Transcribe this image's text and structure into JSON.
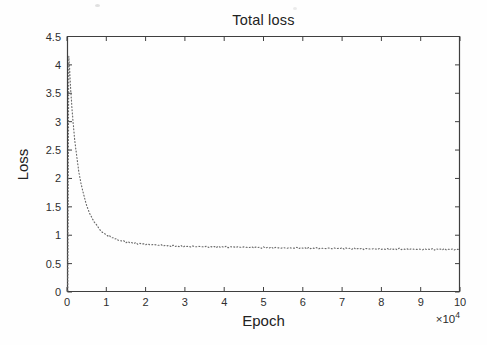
{
  "figure": {
    "title": "Total loss",
    "xlabel": "Epoch",
    "ylabel": "Loss",
    "x_multiplier_base": "×10",
    "x_multiplier_exp": "4"
  },
  "chart_data": {
    "type": "line",
    "title": "Total loss",
    "xlabel": "Epoch",
    "ylabel": "Loss",
    "x_scale_label": "×10^4",
    "xlim": [
      0,
      10
    ],
    "ylim": [
      0,
      4.5
    ],
    "x_ticks": [
      0,
      1,
      2,
      3,
      4,
      5,
      6,
      7,
      8,
      9,
      10
    ],
    "y_ticks": [
      0,
      0.5,
      1,
      1.5,
      2,
      2.5,
      3,
      3.5,
      4,
      4.5
    ],
    "grid": false,
    "legend": null,
    "line_style": "dotted",
    "series": [
      {
        "name": "total-loss",
        "x": [
          0.02,
          0.045,
          0.06,
          0.08,
          0.1,
          0.13,
          0.16,
          0.2,
          0.25,
          0.3,
          0.36,
          0.43,
          0.5,
          0.58,
          0.67,
          0.77,
          0.88,
          1.0,
          1.15,
          1.3,
          1.5,
          1.75,
          2.0,
          2.3,
          2.6,
          3.0,
          3.4,
          3.8,
          4.2,
          4.6,
          5.0,
          5.5,
          6.0,
          6.5,
          7.0,
          7.5,
          8.0,
          8.5,
          9.0,
          9.5,
          10.0
        ],
        "y": [
          0.02,
          4.15,
          4.0,
          3.75,
          3.5,
          3.2,
          2.95,
          2.65,
          2.38,
          2.12,
          1.9,
          1.7,
          1.52,
          1.38,
          1.26,
          1.16,
          1.08,
          1.01,
          0.96,
          0.92,
          0.88,
          0.855,
          0.84,
          0.825,
          0.81,
          0.8,
          0.795,
          0.79,
          0.79,
          0.785,
          0.78,
          0.775,
          0.775,
          0.77,
          0.77,
          0.765,
          0.76,
          0.76,
          0.755,
          0.755,
          0.75
        ]
      }
    ],
    "noise_amplitude_px": 1.1
  },
  "style": {
    "axis_color": "#3f3f3f",
    "tick_label_color": "#2e2e2e",
    "curve_color": "#6a6a6a",
    "background": "#fefefe"
  },
  "layout_geometry": {
    "plot_left": 67,
    "plot_top": 36.5,
    "plot_right": 460,
    "plot_bottom": 292
  }
}
